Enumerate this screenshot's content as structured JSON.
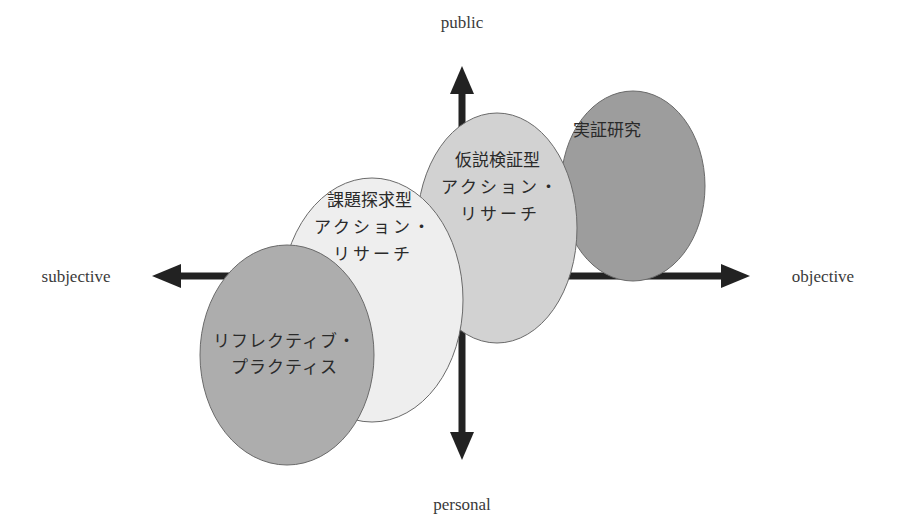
{
  "diagram": {
    "axes": {
      "top": "public",
      "bottom": "personal",
      "left": "subjective",
      "right": "objective"
    },
    "bubbles": [
      {
        "id": "empirical",
        "lines": [
          "実証研究"
        ],
        "fill": "#9a9a9a"
      },
      {
        "id": "hypothesis",
        "lines": [
          "仮説検証型",
          "アクション・",
          "リサーチ"
        ],
        "fill": "#cfcfcf"
      },
      {
        "id": "exploratory",
        "lines": [
          "課題探求型",
          "アクション・",
          "リサーチ"
        ],
        "fill": "#ececec"
      },
      {
        "id": "reflective",
        "lines": [
          "リフレクティブ・",
          "プラクティス"
        ],
        "fill": "#ababab"
      }
    ],
    "colors": {
      "axis": "#222222",
      "stroke": "#6a6a6a"
    }
  }
}
